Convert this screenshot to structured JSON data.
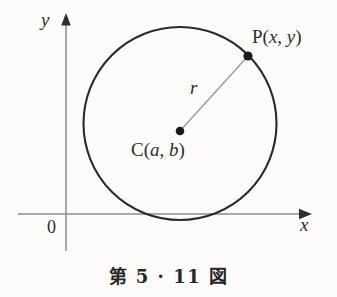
{
  "figure": {
    "caption": "第 5 · 11 図",
    "axes": {
      "y_label": "y",
      "x_label": "x",
      "origin_label": "0"
    },
    "labels": {
      "point_p": "P(x, y)",
      "point_c": "C(a, b)",
      "radius": "r"
    },
    "colors": {
      "background": "#fdfcfa",
      "circle_stroke": "#2a2a2a",
      "axis_stroke": "#8d8d8d",
      "radius_stroke": "#9a9a9a",
      "point_fill": "#1a1a1a",
      "text": "#2b2b2b"
    },
    "geometry": {
      "type": "circle-with-radius",
      "circle": {
        "cx": 180,
        "cy": 123.5,
        "r": 96.5
      },
      "center_point": {
        "x": 180,
        "y": 131
      },
      "boundary_point": {
        "x": 248,
        "y": 56
      },
      "y_axis_x": 66,
      "x_axis_y": 214
    }
  }
}
